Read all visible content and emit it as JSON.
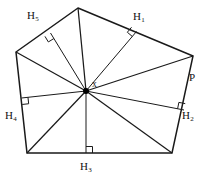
{
  "figure": {
    "kind": "geometry-diagram",
    "canvas": {
      "width": 203,
      "height": 179
    },
    "stroke_color": "#1a1a1a",
    "fill_color": "#ffffff",
    "point_color": "#000000"
  },
  "geometry": {
    "polygon_name": "pentagon",
    "vertices": [
      {
        "name": "top",
        "x": 78,
        "y": 8
      },
      {
        "name": "right",
        "x": 193,
        "y": 56
      },
      {
        "name": "bottom-right",
        "x": 172,
        "y": 153
      },
      {
        "name": "bottom-left",
        "x": 27,
        "y": 153
      },
      {
        "name": "left",
        "x": 16,
        "y": 52
      }
    ],
    "interior_point": {
      "name": "x",
      "x": 86,
      "y": 91
    },
    "spokes": [
      {
        "from": "x",
        "to": "top"
      },
      {
        "from": "x",
        "to": "right"
      },
      {
        "from": "x",
        "to": "bottom-right"
      },
      {
        "from": "x",
        "to": "bottom-left"
      },
      {
        "from": "x",
        "to": "left"
      }
    ],
    "altitudes": [
      {
        "id": "H1",
        "side": "top-right",
        "foot_x": 136.5,
        "foot_y": 31.5
      },
      {
        "id": "H2",
        "side": "right-bottomright",
        "foot_x": 184.0,
        "foot_y": 110.0
      },
      {
        "id": "H3",
        "side": "bottomright-bottomleft",
        "foot_x": 86.0,
        "foot_y": 153.0
      },
      {
        "id": "H4",
        "side": "bottomleft-left",
        "foot_x": 21.5,
        "foot_y": 98.0
      },
      {
        "id": "H5",
        "side": "left-top",
        "foot_x": 50.5,
        "foot_y": 33.0
      }
    ],
    "right_angle_marks": [
      {
        "for": "H1",
        "x": 136.5,
        "y": 31.5
      },
      {
        "for": "H2",
        "x": 184.0,
        "y": 110.0
      },
      {
        "for": "H3",
        "x": 86.0,
        "y": 153.0
      },
      {
        "for": "H4",
        "x": 21.5,
        "y": 98.0
      },
      {
        "for": "H5",
        "x": 50.5,
        "y": 33.0
      }
    ]
  },
  "labels": {
    "h5": {
      "base": "H",
      "sub": "5",
      "x": 27,
      "y": 10
    },
    "h1": {
      "base": "H",
      "sub": "1",
      "x": 133,
      "y": 11
    },
    "p": {
      "base": "P",
      "sub": "",
      "x": 189,
      "y": 72
    },
    "h2": {
      "base": "H",
      "sub": "2",
      "x": 182,
      "y": 110
    },
    "h4": {
      "base": "H",
      "sub": "4",
      "x": 5,
      "y": 110
    },
    "h3": {
      "base": "H",
      "sub": "3",
      "x": 80,
      "y": 161
    },
    "x": {
      "base": "x",
      "sub": "",
      "x": 92,
      "y": 80
    }
  }
}
